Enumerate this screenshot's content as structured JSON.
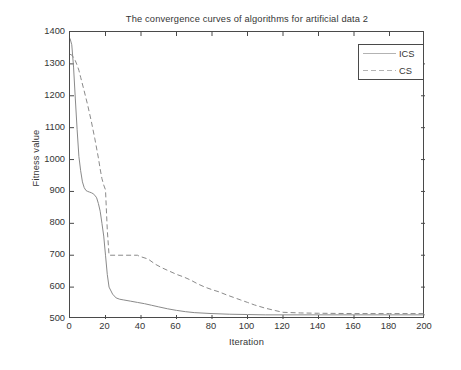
{
  "chart_data": {
    "type": "line",
    "title": "The convergence curves of algorithms for artificial data 2",
    "xlabel": "Iteration",
    "ylabel": "Fitness value",
    "xlim": [
      0,
      200
    ],
    "ylim": [
      500,
      1400
    ],
    "xticks": [
      0,
      20,
      40,
      60,
      80,
      100,
      120,
      140,
      160,
      180,
      200
    ],
    "yticks": [
      500,
      600,
      700,
      800,
      900,
      1000,
      1100,
      1200,
      1300,
      1400
    ],
    "grid": false,
    "legend_position": "upper right",
    "series": [
      {
        "name": "ICS",
        "style": "solid",
        "color": "#8a8a8a",
        "x": [
          0,
          1,
          2,
          3,
          4,
          5,
          6,
          7,
          8,
          9,
          10,
          11,
          12,
          13,
          14,
          15,
          16,
          17,
          18,
          19,
          20,
          21,
          22,
          24,
          26,
          28,
          30,
          34,
          38,
          42,
          46,
          50,
          55,
          60,
          65,
          70,
          80,
          90,
          100,
          110,
          120,
          140,
          160,
          180,
          200
        ],
        "y": [
          1380,
          1360,
          1290,
          1190,
          1095,
          1010,
          965,
          930,
          912,
          903,
          900,
          898,
          896,
          893,
          888,
          880,
          862,
          838,
          800,
          760,
          700,
          640,
          600,
          578,
          566,
          562,
          560,
          556,
          552,
          548,
          543,
          538,
          532,
          527,
          523,
          520,
          517,
          515,
          514,
          513,
          513,
          513,
          513,
          513,
          513
        ]
      },
      {
        "name": "CS",
        "style": "dashed",
        "color": "#8a8a8a",
        "x": [
          0,
          1,
          2,
          3,
          4,
          5,
          6,
          8,
          10,
          12,
          14,
          16,
          17,
          18,
          19,
          20,
          21,
          22,
          30,
          38,
          39,
          44,
          48,
          52,
          56,
          60,
          64,
          68,
          72,
          76,
          80,
          84,
          88,
          92,
          96,
          100,
          104,
          110,
          116,
          120,
          130,
          140,
          160,
          180,
          200
        ],
        "y": [
          1330,
          1328,
          1320,
          1310,
          1296,
          1280,
          1258,
          1215,
          1170,
          1120,
          1065,
          1005,
          970,
          940,
          920,
          905,
          780,
          700,
          700,
          700,
          697,
          688,
          672,
          660,
          650,
          640,
          632,
          622,
          610,
          600,
          592,
          585,
          576,
          568,
          560,
          552,
          544,
          534,
          526,
          521,
          519,
          518,
          517,
          517,
          517
        ]
      }
    ]
  },
  "legend": {
    "items": [
      {
        "label": "ICS",
        "style": "solid"
      },
      {
        "label": "CS",
        "style": "dashed"
      }
    ]
  }
}
